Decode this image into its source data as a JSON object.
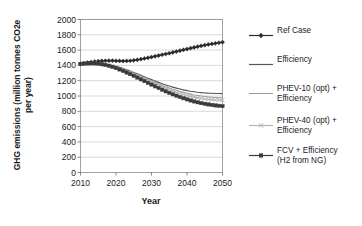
{
  "chart_data": {
    "type": "line",
    "title": "",
    "xlabel": "Year",
    "ylabel": "GHG emissions (million tonnes CO2e per year)",
    "ylabel_line1": "GHG emissions (million tonnes CO2e",
    "ylabel_line2": "per year)",
    "xlim": [
      2010,
      2050
    ],
    "ylim": [
      0,
      2000
    ],
    "ytick_labels": [
      "0",
      "200",
      "400",
      "600",
      "800",
      "1000",
      "1200",
      "1400",
      "1600",
      "1800",
      "2000"
    ],
    "ytick_values": [
      0,
      200,
      400,
      600,
      800,
      1000,
      1200,
      1400,
      1600,
      1800,
      2000
    ],
    "xtick_labels": [
      "2010",
      "2020",
      "2030",
      "2040",
      "2050"
    ],
    "xtick_values": [
      2010,
      2020,
      2030,
      2040,
      2050
    ],
    "grid": "horizontal",
    "legend_position": "right",
    "x": [
      2010,
      2011,
      2012,
      2013,
      2014,
      2015,
      2016,
      2017,
      2018,
      2019,
      2020,
      2021,
      2022,
      2023,
      2024,
      2025,
      2026,
      2027,
      2028,
      2029,
      2030,
      2031,
      2032,
      2033,
      2034,
      2035,
      2036,
      2037,
      2038,
      2039,
      2040,
      2041,
      2042,
      2043,
      2044,
      2045,
      2046,
      2047,
      2048,
      2049,
      2050
    ],
    "series": [
      {
        "name": "Ref Case",
        "color": "#2b2b2b",
        "marker": "diamond",
        "values": [
          1420,
          1428,
          1436,
          1443,
          1450,
          1455,
          1459,
          1461,
          1462,
          1462,
          1460,
          1458,
          1457,
          1458,
          1461,
          1466,
          1473,
          1481,
          1490,
          1499,
          1509,
          1519,
          1529,
          1539,
          1549,
          1559,
          1570,
          1581,
          1592,
          1603,
          1614,
          1625,
          1635,
          1645,
          1655,
          1664,
          1673,
          1681,
          1689,
          1696,
          1703
        ]
      },
      {
        "name": "Efficiency",
        "color": "#555555",
        "marker": "none",
        "values": [
          1420,
          1424,
          1428,
          1430,
          1430,
          1428,
          1424,
          1418,
          1410,
          1400,
          1388,
          1374,
          1359,
          1343,
          1326,
          1308,
          1290,
          1271,
          1252,
          1233,
          1214,
          1196,
          1178,
          1161,
          1145,
          1130,
          1116,
          1103,
          1091,
          1080,
          1070,
          1062,
          1055,
          1049,
          1044,
          1040,
          1037,
          1035,
          1033,
          1032,
          1031
        ]
      },
      {
        "name": "PHEV-10 (opt) + Efficiency",
        "color": "#9a9a9a",
        "marker": "none",
        "values": [
          1420,
          1424,
          1428,
          1430,
          1429,
          1426,
          1421,
          1414,
          1405,
          1394,
          1381,
          1366,
          1350,
          1333,
          1315,
          1296,
          1277,
          1257,
          1237,
          1217,
          1197,
          1177,
          1158,
          1140,
          1122,
          1105,
          1089,
          1074,
          1060,
          1047,
          1035,
          1024,
          1014,
          1006,
          999,
          993,
          988,
          984,
          981,
          979,
          978
        ]
      },
      {
        "name": "PHEV-40 (opt) + Efficiency",
        "color": "#b5b5b5",
        "marker": "cross",
        "values": [
          1420,
          1424,
          1427,
          1429,
          1428,
          1424,
          1418,
          1410,
          1400,
          1388,
          1374,
          1358,
          1341,
          1323,
          1304,
          1284,
          1264,
          1243,
          1222,
          1201,
          1180,
          1159,
          1139,
          1119,
          1100,
          1082,
          1065,
          1049,
          1034,
          1020,
          1007,
          995,
          985,
          976,
          968,
          961,
          956,
          952,
          949,
          947,
          946
        ]
      },
      {
        "name": "FCV + Efficiency (H2 from NG)",
        "color": "#3a3a3a",
        "marker": "square",
        "values": [
          1420,
          1423,
          1426,
          1427,
          1426,
          1422,
          1415,
          1406,
          1395,
          1381,
          1365,
          1347,
          1328,
          1307,
          1286,
          1264,
          1241,
          1218,
          1195,
          1172,
          1149,
          1126,
          1104,
          1082,
          1061,
          1041,
          1022,
          1004,
          987,
          971,
          956,
          942,
          929,
          918,
          907,
          898,
          890,
          883,
          877,
          872,
          868
        ]
      }
    ],
    "legend": [
      {
        "label": "Ref Case",
        "key": "line-diamond",
        "color": "#2b2b2b"
      },
      {
        "label": "Efficiency",
        "key": "line-plain",
        "color": "#555555"
      },
      {
        "label": "PHEV-10 (opt) +\nEfficiency",
        "key": "line-plain-light",
        "color": "#9a9a9a"
      },
      {
        "label": "PHEV-40 (opt) +\nEfficiency",
        "key": "line-cross",
        "color": "#b5b5b5"
      },
      {
        "label": "FCV + Efficiency\n(H2 from NG)",
        "key": "line-square",
        "color": "#3a3a3a"
      }
    ]
  }
}
